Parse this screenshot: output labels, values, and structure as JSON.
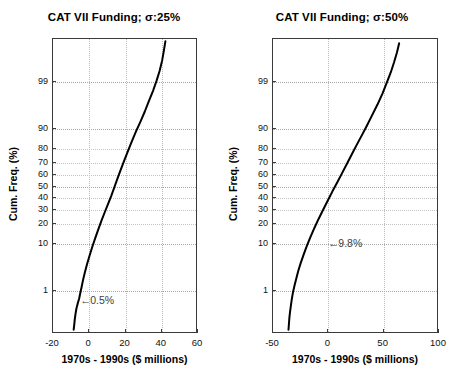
{
  "figure": {
    "width": 457,
    "height": 389,
    "background": "#ffffff",
    "panel_count": 2
  },
  "chart_data": [
    {
      "type": "line",
      "id": "cat7-sigma-25",
      "title": "CAT VII Funding; σ:25%",
      "subtitle": "",
      "xlabel": "1970s - 1990s ($ millions)",
      "ylabel": "Cum. Freq. (%)",
      "plot_kind": "normal-probability-plot",
      "grid": true,
      "legend": null,
      "xlim": [
        -20,
        60
      ],
      "xticks": [
        -20,
        0,
        20,
        40,
        60
      ],
      "xticklabels": [
        "-20",
        "0",
        "20",
        "40",
        "60"
      ],
      "ylim_percent": [
        0.05,
        99.95
      ],
      "yticks": [
        1,
        10,
        20,
        30,
        40,
        50,
        60,
        70,
        80,
        90,
        99
      ],
      "yticklabels": [
        "1",
        "10",
        "20",
        "30",
        "40",
        "50",
        "60",
        "70",
        "80",
        "90",
        "99"
      ],
      "annotations": [
        {
          "text": "0.5%",
          "arrow": "←",
          "x_value": -5.0,
          "y_percent": 0.5,
          "description": "arrow pointing left to the curve at 0.5 percent cumulative frequency"
        }
      ],
      "series": [
        {
          "name": "CAT VII funding cumulative distribution",
          "color": "#000000",
          "linewidth": 2.0,
          "points": [
            {
              "x": -8.6,
              "p": 0.07
            },
            {
              "x": -8.3,
              "p": 0.1
            },
            {
              "x": -8.0,
              "p": 0.15
            },
            {
              "x": -7.6,
              "p": 0.22
            },
            {
              "x": -7.1,
              "p": 0.32
            },
            {
              "x": -6.4,
              "p": 0.45
            },
            {
              "x": -5.6,
              "p": 0.62
            },
            {
              "x": -5.0,
              "p": 0.85
            },
            {
              "x": -4.3,
              "p": 1.2
            },
            {
              "x": -3.5,
              "p": 1.8
            },
            {
              "x": -2.4,
              "p": 2.8
            },
            {
              "x": -1.2,
              "p": 4.2
            },
            {
              "x": 0.2,
              "p": 6.2
            },
            {
              "x": 1.7,
              "p": 9.0
            },
            {
              "x": 3.3,
              "p": 12.5
            },
            {
              "x": 5.0,
              "p": 17.0
            },
            {
              "x": 6.8,
              "p": 22.5
            },
            {
              "x": 8.6,
              "p": 28.5
            },
            {
              "x": 10.4,
              "p": 35.0
            },
            {
              "x": 12.2,
              "p": 42.0
            },
            {
              "x": 14.0,
              "p": 50.0
            },
            {
              "x": 15.8,
              "p": 58.0
            },
            {
              "x": 17.6,
              "p": 65.5
            },
            {
              "x": 19.5,
              "p": 72.5
            },
            {
              "x": 21.5,
              "p": 79.0
            },
            {
              "x": 23.6,
              "p": 84.5
            },
            {
              "x": 25.8,
              "p": 89.0
            },
            {
              "x": 28.2,
              "p": 92.5
            },
            {
              "x": 30.6,
              "p": 95.2
            },
            {
              "x": 33.0,
              "p": 97.2
            },
            {
              "x": 35.3,
              "p": 98.4
            },
            {
              "x": 37.2,
              "p": 99.1
            },
            {
              "x": 38.8,
              "p": 99.5
            },
            {
              "x": 40.2,
              "p": 99.75
            },
            {
              "x": 41.2,
              "p": 99.88
            },
            {
              "x": 42.0,
              "p": 99.94
            }
          ]
        }
      ]
    },
    {
      "type": "line",
      "id": "cat7-sigma-50",
      "title": "CAT VII Funding; σ:50%",
      "subtitle": "",
      "xlabel": "1970s - 1990s ($ millions)",
      "ylabel": "Cum. Freq. (%)",
      "plot_kind": "normal-probability-plot",
      "grid": true,
      "legend": null,
      "xlim": [
        -50,
        100
      ],
      "xticks": [
        -50,
        0,
        50,
        100
      ],
      "xticklabels": [
        "-50",
        "0",
        "50",
        "100"
      ],
      "ylim_percent": [
        0.05,
        99.95
      ],
      "yticks": [
        1,
        10,
        20,
        30,
        40,
        50,
        60,
        70,
        80,
        90,
        99
      ],
      "yticklabels": [
        "1",
        "10",
        "20",
        "30",
        "40",
        "50",
        "60",
        "70",
        "80",
        "90",
        "99"
      ],
      "annotations": [
        {
          "text": "9.8%",
          "arrow": "←",
          "x_value": 0.0,
          "y_percent": 9.8,
          "description": "arrow pointing left to the curve at 9.8 percent cumulative frequency"
        }
      ],
      "series": [
        {
          "name": "CAT VII funding cumulative distribution",
          "color": "#000000",
          "linewidth": 2.0,
          "points": [
            {
              "x": -36.0,
              "p": 0.07
            },
            {
              "x": -35.6,
              "p": 0.11
            },
            {
              "x": -35.2,
              "p": 0.17
            },
            {
              "x": -34.6,
              "p": 0.26
            },
            {
              "x": -33.8,
              "p": 0.4
            },
            {
              "x": -33.0,
              "p": 0.6
            },
            {
              "x": -32.0,
              "p": 0.9
            },
            {
              "x": -30.6,
              "p": 1.35
            },
            {
              "x": -29.0,
              "p": 2.0
            },
            {
              "x": -27.2,
              "p": 3.0
            },
            {
              "x": -25.0,
              "p": 4.4
            },
            {
              "x": -22.4,
              "p": 6.4
            },
            {
              "x": -19.5,
              "p": 9.2
            },
            {
              "x": -16.2,
              "p": 13.0
            },
            {
              "x": -12.6,
              "p": 17.8
            },
            {
              "x": -8.8,
              "p": 23.5
            },
            {
              "x": -4.8,
              "p": 30.0
            },
            {
              "x": -0.6,
              "p": 37.5
            },
            {
              "x": 3.6,
              "p": 45.5
            },
            {
              "x": 8.0,
              "p": 53.5
            },
            {
              "x": 12.3,
              "p": 61.5
            },
            {
              "x": 16.6,
              "p": 69.0
            },
            {
              "x": 21.0,
              "p": 76.0
            },
            {
              "x": 25.4,
              "p": 82.0
            },
            {
              "x": 30.0,
              "p": 87.0
            },
            {
              "x": 34.8,
              "p": 91.2
            },
            {
              "x": 39.6,
              "p": 94.4
            },
            {
              "x": 44.4,
              "p": 96.6
            },
            {
              "x": 49.0,
              "p": 98.1
            },
            {
              "x": 53.0,
              "p": 99.0
            },
            {
              "x": 56.4,
              "p": 99.45
            },
            {
              "x": 59.4,
              "p": 99.72
            },
            {
              "x": 62.0,
              "p": 99.86
            },
            {
              "x": 64.0,
              "p": 99.93
            }
          ]
        }
      ]
    }
  ]
}
